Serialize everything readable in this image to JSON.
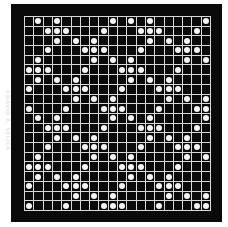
{
  "credit": "©DAVID A. SELICK",
  "colors": {
    "board": "#0a0a0a",
    "gridline": "#d8d8d8",
    "dot": "#f4f4f4",
    "background": "#ffffff"
  },
  "grid": {
    "rows": 20,
    "cols": 20,
    "dots": [
      [
        1,
        3,
        9,
        11,
        13,
        19
      ],
      [
        2,
        3,
        4,
        8,
        12,
        13,
        14,
        18
      ],
      [
        3,
        5,
        7,
        13,
        15,
        17
      ],
      [
        2,
        6,
        7,
        8,
        12,
        16,
        17,
        18
      ],
      [
        1,
        7,
        9,
        11,
        17,
        19
      ],
      [
        0,
        1,
        2,
        6,
        10,
        11,
        12,
        16
      ],
      [
        1,
        3,
        5,
        11,
        13,
        15
      ],
      [
        0,
        4,
        5,
        6,
        10,
        14,
        15,
        16
      ],
      [
        5,
        7,
        9,
        15,
        17,
        19
      ],
      [
        0,
        4,
        8,
        9,
        10,
        14,
        18,
        19
      ],
      [
        1,
        3,
        9,
        11,
        13,
        19
      ],
      [
        2,
        3,
        4,
        8,
        12,
        13,
        14,
        18
      ],
      [
        3,
        5,
        7,
        13,
        15,
        17
      ],
      [
        2,
        6,
        7,
        8,
        12,
        16,
        17,
        18
      ],
      [
        1,
        7,
        9,
        11,
        17,
        19
      ],
      [
        0,
        1,
        2,
        6,
        10,
        11,
        12,
        16
      ],
      [
        1,
        3,
        5,
        11,
        13,
        15
      ],
      [
        0,
        4,
        5,
        6,
        10,
        14,
        15,
        16
      ],
      [
        5,
        7,
        9,
        15,
        17,
        19
      ],
      [
        0,
        4,
        8,
        9,
        10,
        14,
        18,
        19
      ]
    ]
  }
}
